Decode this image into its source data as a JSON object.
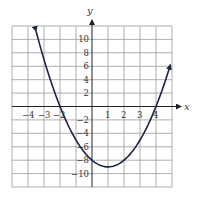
{
  "chart_data": {
    "type": "line",
    "title": "",
    "xlabel": "x",
    "ylabel": "y",
    "xlim": [
      -5,
      5
    ],
    "ylim": [
      -12,
      12
    ],
    "grid": true,
    "x_grid_step": 1,
    "y_grid_step": 2,
    "x_tick_labels": [
      "-4",
      "-3",
      "-2",
      "1",
      "2",
      "3",
      "4"
    ],
    "y_tick_labels": [
      "10",
      "8",
      "6",
      "4",
      "2",
      "-2",
      "-4",
      "-6",
      "-8",
      "-10"
    ],
    "function": "y = x^2 - 2x - 8",
    "series": [
      {
        "name": "parabola",
        "x": [
          -3.5,
          -3,
          -2,
          -1,
          0,
          1,
          2,
          3,
          4,
          4.9
        ],
        "y": [
          11.25,
          7,
          0,
          -5,
          -8,
          -9,
          -8,
          -5,
          0,
          6.21
        ]
      }
    ],
    "vertex": [
      1,
      -9
    ],
    "x_intercepts": [
      -2,
      4
    ],
    "y_intercept": -8,
    "arrows_on_ends": true,
    "colors": {
      "curve": "#1c2540",
      "grid": "#9a9a9a",
      "axis": "#222222"
    }
  },
  "labels": {
    "x_axis": "x",
    "y_axis": "y",
    "xt": {
      "m4": "−4",
      "m3": "−3",
      "m2": "−2",
      "p1": "1",
      "p2": "2",
      "p3": "3",
      "p4": "4"
    },
    "yt": {
      "p10": "10",
      "p8": "8",
      "p6": "6",
      "p4": "4",
      "p2": "2",
      "m2": "−2",
      "m4": "−4",
      "m6": "−6",
      "m8": "−8",
      "m10": "−10"
    }
  }
}
